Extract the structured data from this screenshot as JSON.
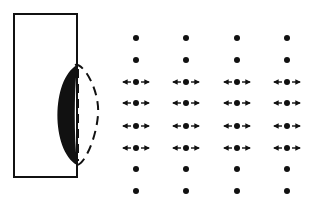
{
  "diagram": {
    "colors": {
      "ink": "#111111",
      "background": "#ffffff"
    },
    "panel": {
      "x": 14,
      "y": 14,
      "width": 63,
      "height": 163
    },
    "lens": {
      "filled_crescent": {
        "top_y": 65,
        "bottom_y": 165,
        "left_x": 57,
        "edge_x": 77
      },
      "dashed_outline": {
        "right_x": 98
      }
    },
    "grid": {
      "columns_x": [
        136,
        186,
        237,
        287
      ],
      "rows": [
        {
          "y": 38,
          "arrows": false
        },
        {
          "y": 60,
          "arrows": false
        },
        {
          "y": 82,
          "arrows": true
        },
        {
          "y": 103,
          "arrows": true
        },
        {
          "y": 126,
          "arrows": true
        },
        {
          "y": 148,
          "arrows": true
        },
        {
          "y": 169,
          "arrows": false
        },
        {
          "y": 191,
          "arrows": false
        }
      ],
      "dot_radius": 3,
      "arrow_length": 8,
      "arrow_offset": 5
    }
  }
}
